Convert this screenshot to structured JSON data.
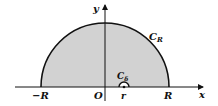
{
  "diagram": {
    "type": "contour",
    "labels": {
      "y_axis": "y",
      "x_axis": "x",
      "big_arc": "C",
      "big_arc_sub": "R",
      "small_arc": "C",
      "small_arc_sub": "δ",
      "neg_R": "−R",
      "origin": "O",
      "r": "r",
      "pos_R": "R"
    },
    "colors": {
      "fill": "#d2d2d2",
      "stroke": "#111111",
      "background": "#ffffff"
    }
  }
}
